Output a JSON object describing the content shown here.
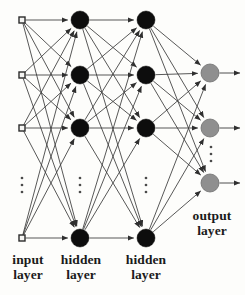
{
  "diagram": {
    "canvas": {
      "width": 245,
      "height": 295
    },
    "colors": {
      "background": "#fdfdfb",
      "edge": "#3a3a3a",
      "input_node_stroke": "#2b2b2b",
      "input_node_fill": "#f4f4f2",
      "hidden_node_fill": "#0d0d0d",
      "output_node_fill": "#8f8f8f",
      "output_node_stroke": "#6e6e6e",
      "label_text": "#1a1a1a",
      "ellipsis": "#4a4a4a"
    },
    "labels": {
      "input_layer": "input\nlayer",
      "hidden_layer_1": "hidden\nlayer",
      "hidden_layer_2": "hidden\nlayer",
      "output_layer": "output\nlayer"
    },
    "layers": [
      {
        "id": "input",
        "name": "input layer",
        "shape": "square",
        "x": 22,
        "node_size": 6,
        "nodes": [
          {
            "id": "i1",
            "y": 20
          },
          {
            "id": "i2",
            "y": 75
          },
          {
            "id": "i3",
            "y": 128
          },
          {
            "id": "i4",
            "y": 238
          }
        ],
        "ellipsis": {
          "x": 22,
          "y": 185
        }
      },
      {
        "id": "hidden1",
        "name": "hidden layer",
        "shape": "circle",
        "x": 80,
        "node_size": 9,
        "nodes": [
          {
            "id": "h1a",
            "y": 20
          },
          {
            "id": "h1b",
            "y": 75
          },
          {
            "id": "h1c",
            "y": 128
          },
          {
            "id": "h1d",
            "y": 238
          }
        ],
        "ellipsis": {
          "x": 80,
          "y": 185
        }
      },
      {
        "id": "hidden2",
        "name": "hidden layer",
        "shape": "circle",
        "x": 146,
        "node_size": 9,
        "nodes": [
          {
            "id": "h2a",
            "y": 20
          },
          {
            "id": "h2b",
            "y": 75
          },
          {
            "id": "h2c",
            "y": 128
          },
          {
            "id": "h2d",
            "y": 238
          }
        ],
        "ellipsis": {
          "x": 146,
          "y": 185
        }
      },
      {
        "id": "output",
        "name": "output layer",
        "shape": "circle",
        "x": 210,
        "node_size": 9,
        "nodes": [
          {
            "id": "o1",
            "y": 73
          },
          {
            "id": "o2",
            "y": 128
          },
          {
            "id": "o3",
            "y": 183
          }
        ],
        "ellipsis": {
          "x": 211,
          "y": 154
        }
      }
    ],
    "connections": {
      "fully_connected": true,
      "arrowheads": true,
      "input_to_hidden1": 16,
      "hidden1_to_hidden2": 16,
      "hidden2_to_output": 12,
      "output_arrows_out": 3
    }
  }
}
